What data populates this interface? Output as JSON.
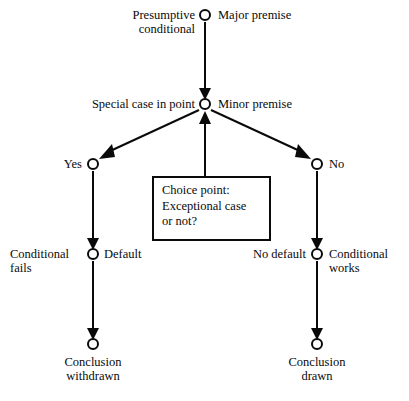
{
  "diagram": {
    "type": "flowchart",
    "title": "",
    "node_style": {
      "shape": "open-circle",
      "radius": 5,
      "fill": "#ffffff",
      "stroke": "#0a0a0a",
      "stroke_width": 2
    },
    "edge_style": {
      "stroke": "#0a0a0a",
      "stroke_width": 2,
      "arrowhead": "solid-triangle"
    },
    "nodes": [
      {
        "id": "major_premise",
        "x": 205,
        "y": 15,
        "left_label": "Presumptive\nconditional",
        "right_label": "Major premise"
      },
      {
        "id": "minor_premise",
        "x": 205,
        "y": 104,
        "left_label": "Special case in point",
        "right_label": "Minor premise"
      },
      {
        "id": "yes",
        "x": 93,
        "y": 164,
        "left_label": "Yes",
        "right_label": ""
      },
      {
        "id": "no",
        "x": 317,
        "y": 164,
        "left_label": "",
        "right_label": "No"
      },
      {
        "id": "default",
        "x": 93,
        "y": 254,
        "left_label": "Conditional\nfails",
        "right_label": "Default"
      },
      {
        "id": "no_default",
        "x": 317,
        "y": 254,
        "left_label": "No default",
        "right_label": "Conditional\n      works"
      },
      {
        "id": "conclusion_withdrawn",
        "x": 93,
        "y": 344,
        "left_label": "",
        "right_label": "",
        "below_label": "Conclusion\nwithdrawn"
      },
      {
        "id": "conclusion_drawn",
        "x": 317,
        "y": 344,
        "left_label": "",
        "right_label": "",
        "below_label": "Conclusion\ndrawn"
      }
    ],
    "edges": [
      {
        "from": "major_premise",
        "to": "minor_premise",
        "label": ""
      },
      {
        "from": "minor_premise",
        "to": "yes",
        "label": ""
      },
      {
        "from": "minor_premise",
        "to": "no",
        "label": ""
      },
      {
        "from": "yes",
        "to": "default",
        "label": ""
      },
      {
        "from": "no",
        "to": "no_default",
        "label": ""
      },
      {
        "from": "default",
        "to": "conclusion_withdrawn",
        "label": ""
      },
      {
        "from": "no_default",
        "to": "conclusion_drawn",
        "label": ""
      },
      {
        "from": "choice_point_box",
        "to": "minor_premise",
        "label": ""
      }
    ],
    "box": {
      "id": "choice_point_box",
      "x": 153,
      "y": 177,
      "width": 117,
      "height": 63,
      "stroke": "#0a0a0a",
      "stroke_width": 2,
      "fill": "#ffffff",
      "text": "Choice point:\nExceptional case\nor not?"
    }
  },
  "labels": {
    "presumptive_conditional": "Presumptive\nconditional",
    "major_premise": "Major premise",
    "special_case_in_point": "Special case in point",
    "minor_premise": "Minor premise",
    "yes": "Yes",
    "no": "No",
    "conditional_fails": "Conditional\nfails",
    "default": "Default",
    "no_default": "No default",
    "conditional_works": "Conditional\n      works",
    "conclusion_withdrawn": "Conclusion\nwithdrawn",
    "conclusion_drawn": "Conclusion\ndrawn",
    "choice_point_box": "Choice point:\nExceptional case\nor not?"
  }
}
